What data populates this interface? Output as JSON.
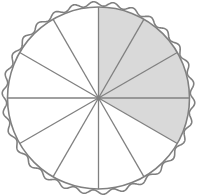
{
  "figure": {
    "type": "fraction-pie",
    "total_slices": 12,
    "shaded_slices": 4,
    "shaded_start_clock": "12 o'clock",
    "shaded_end_clock": "4 o'clock",
    "fraction_shaded": "4/12",
    "colors": {
      "outline": "#808080",
      "shade": "#d9d9d9",
      "background": "#ffffff"
    },
    "crust": "wavy"
  }
}
